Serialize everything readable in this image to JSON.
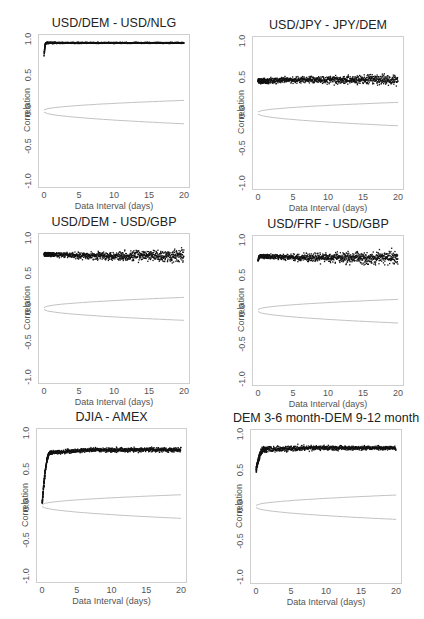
{
  "chart_data": [
    {
      "type": "scatter",
      "title": "USD/DEM - USD/NLG",
      "xlabel": "Data Interval (days)",
      "ylabel": "Correlation",
      "xlim": [
        0,
        20
      ],
      "ylim": [
        -1.0,
        1.0
      ],
      "xticks": [
        "0",
        "5",
        "10",
        "15",
        "20"
      ],
      "yticks": [
        "-1.0",
        "-0.5",
        "0.0",
        "0.5",
        "1.0"
      ],
      "grid": false,
      "series": [
        {
          "name": "correlation",
          "profile": {
            "start": 0.78,
            "rise_to": 0.96,
            "rise_end_x": 0.3,
            "level": 0.96,
            "spread_start": 0.01,
            "spread_end": 0.01
          }
        },
        {
          "name": "confidence band",
          "upper_end": 0.15,
          "lower_end": -0.18
        }
      ],
      "frame": {
        "x": 38,
        "y": 34,
        "w": 152,
        "h": 154
      }
    },
    {
      "type": "scatter",
      "title": "USD/JPY - JPY/DEM",
      "xlabel": "Data Interval (days)",
      "ylabel": "Correlation",
      "xlim": [
        0,
        20
      ],
      "ylim": [
        -1.0,
        1.0
      ],
      "xticks": [
        "0",
        "5",
        "10",
        "15",
        "20"
      ],
      "yticks": [
        "-1.0",
        "-0.5",
        "0.0",
        "0.5",
        "1.0"
      ],
      "grid": false,
      "series": [
        {
          "name": "correlation",
          "profile": {
            "start": 0.45,
            "rise_to": 0.45,
            "rise_end_x": 0.0,
            "level": 0.47,
            "spread_start": 0.04,
            "spread_end": 0.09
          }
        },
        {
          "name": "confidence band",
          "upper_end": 0.15,
          "lower_end": -0.18
        }
      ],
      "frame": {
        "x": 252,
        "y": 36,
        "w": 152,
        "h": 154
      }
    },
    {
      "type": "scatter",
      "title": "USD/DEM - USD/GBP",
      "xlabel": "Data Interval (days)",
      "ylabel": "Correlation",
      "xlim": [
        0,
        20
      ],
      "ylim": [
        -1.0,
        1.0
      ],
      "xticks": [
        "0",
        "5",
        "10",
        "15",
        "20"
      ],
      "yticks": [
        "-1.0",
        "-0.5",
        "0.0",
        "0.5",
        "1.0"
      ],
      "grid": false,
      "series": [
        {
          "name": "correlation",
          "profile": {
            "start": 0.78,
            "rise_to": 0.78,
            "rise_end_x": 0.0,
            "level": 0.76,
            "spread_start": 0.03,
            "spread_end": 0.12
          }
        },
        {
          "name": "confidence band",
          "upper_end": 0.16,
          "lower_end": -0.17
        }
      ],
      "frame": {
        "x": 38,
        "y": 233,
        "w": 152,
        "h": 151
      }
    },
    {
      "type": "scatter",
      "title": "USD/FRF - USD/GBP",
      "xlabel": "Data Interval (days)",
      "ylabel": "Correlation",
      "xlim": [
        0,
        20
      ],
      "ylim": [
        -1.0,
        1.0
      ],
      "xticks": [
        "0",
        "5",
        "10",
        "15",
        "20"
      ],
      "yticks": [
        "-1.0",
        "-0.5",
        "0.0",
        "0.5",
        "1.0"
      ],
      "grid": false,
      "series": [
        {
          "name": "correlation",
          "profile": {
            "start": 0.72,
            "rise_to": 0.78,
            "rise_end_x": 0.3,
            "level": 0.76,
            "spread_start": 0.03,
            "spread_end": 0.13
          }
        },
        {
          "name": "confidence band",
          "upper_end": 0.16,
          "lower_end": -0.18
        }
      ],
      "frame": {
        "x": 252,
        "y": 235,
        "w": 152,
        "h": 151
      }
    },
    {
      "type": "scatter",
      "title": "DJIA - AMEX",
      "xlabel": "Data Interval (days)",
      "ylabel": "Correlation",
      "xlim": [
        0,
        20
      ],
      "ylim": [
        -1.0,
        1.0
      ],
      "xticks": [
        "0",
        "5",
        "10",
        "15",
        "20"
      ],
      "yticks": [
        "-1.0",
        "-0.5",
        "0.0",
        "0.5",
        "1.0"
      ],
      "grid": false,
      "series": [
        {
          "name": "correlation",
          "profile": {
            "start": 0.0,
            "rise_to": 0.74,
            "rise_end_x": 1.2,
            "level": 0.78,
            "spread_start": 0.03,
            "spread_end": 0.04
          }
        },
        {
          "name": "confidence band",
          "upper_end": 0.15,
          "lower_end": -0.18
        }
      ],
      "frame": {
        "x": 36,
        "y": 428,
        "w": 151,
        "h": 155
      }
    },
    {
      "type": "scatter",
      "title": "DEM 3-6 month-DEM 9-12 month",
      "xlabel": "Data Interval (days)",
      "ylabel": "Correlation",
      "xlim": [
        0,
        20
      ],
      "ylim": [
        -1.0,
        1.0
      ],
      "xticks": [
        "0",
        "5",
        "10",
        "15",
        "20"
      ],
      "yticks": [
        "-1.0",
        "-0.5",
        "0.0",
        "0.5",
        "1.0"
      ],
      "grid": false,
      "series": [
        {
          "name": "correlation",
          "profile": {
            "start": 0.5,
            "rise_to": 0.8,
            "rise_end_x": 1.2,
            "level": 0.82,
            "spread_start": 0.05,
            "spread_end": 0.03
          }
        },
        {
          "name": "confidence band",
          "upper_end": 0.16,
          "lower_end": -0.18
        }
      ],
      "frame": {
        "x": 250,
        "y": 429,
        "w": 152,
        "h": 155
      }
    }
  ]
}
